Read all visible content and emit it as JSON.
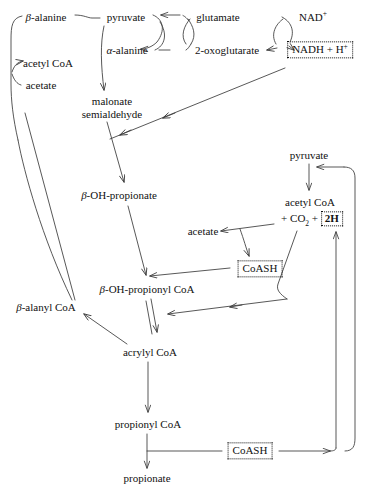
{
  "diagram": {
    "background_color": "#ffffff",
    "line_color": "#3a3a3a",
    "text_color": "#111111",
    "nodes": [
      {
        "id": "beta_alanine",
        "label": "β-alanine",
        "x": 46,
        "y": 17
      },
      {
        "id": "pyruvate_top",
        "label": "pyruvate",
        "x": 126,
        "y": 17
      },
      {
        "id": "glutamate",
        "label": "glutamate",
        "x": 218,
        "y": 17
      },
      {
        "id": "nad_plus",
        "label": "NAD",
        "sup": "+",
        "x": 313,
        "y": 17
      },
      {
        "id": "alpha_alanine",
        "label": "α-alanine",
        "x": 127,
        "y": 50
      },
      {
        "id": "oxoglutarate",
        "label": "2-oxoglutarate",
        "x": 227,
        "y": 50
      },
      {
        "id": "nadh_h",
        "label": "NADH + H",
        "sup": "+",
        "x": 320,
        "y": 50,
        "boxed": true
      },
      {
        "id": "acetyl_coa_left",
        "label": "acetyl CoA",
        "x": 48,
        "y": 63
      },
      {
        "id": "acetate_left",
        "label": "acetate",
        "x": 41,
        "y": 85
      },
      {
        "id": "malonate_semialdehyde",
        "label": "malonate\nsemialdehyde",
        "x": 112,
        "y": 108
      },
      {
        "id": "pyruvate_right",
        "label": "pyruvate",
        "x": 309,
        "y": 155
      },
      {
        "id": "beta_oh_propionate",
        "label": "β-OH-propionate",
        "x": 119,
        "y": 195
      },
      {
        "id": "acetyl_coa_right",
        "label": "acetyl CoA",
        "x": 310,
        "y": 202
      },
      {
        "id": "co2_2h",
        "label": "+ CO",
        "sub": "2",
        "suffix": " + ",
        "boxed_text": "2H",
        "x": 310,
        "y": 218
      },
      {
        "id": "acetate_right",
        "label": "acetate",
        "x": 203,
        "y": 231
      },
      {
        "id": "coash_mid",
        "label": "CoASH",
        "x": 260,
        "y": 269,
        "boxed": true
      },
      {
        "id": "beta_oh_propionyl_coa",
        "label": "β-OH-propionyl CoA",
        "x": 147,
        "y": 289
      },
      {
        "id": "beta_alanyl_coa",
        "label": "β-alanyl CoA",
        "x": 46,
        "y": 307
      },
      {
        "id": "acrylyl_coa",
        "label": "acrylyl CoA",
        "x": 150,
        "y": 352
      },
      {
        "id": "propionyl_coa",
        "label": "propionyl CoA",
        "x": 148,
        "y": 424
      },
      {
        "id": "coash_bottom",
        "label": "CoASH",
        "x": 250,
        "y": 451,
        "boxed": true
      },
      {
        "id": "propionate",
        "label": "propionate",
        "x": 147,
        "y": 478
      }
    ],
    "edges": [
      {
        "id": "beta-alanine-to-pyruvate",
        "from": "beta_alanine",
        "to": "pyruvate_top",
        "style": "curve"
      },
      {
        "id": "pyruvate-to-alpha-alanine",
        "from": "pyruvate_top",
        "to": "alpha_alanine",
        "style": "cofactor-cross"
      },
      {
        "id": "alpha-alanine-to-oxoglutarate",
        "from": "alpha_alanine",
        "to": "oxoglutarate",
        "style": "curve"
      },
      {
        "id": "glutamate-to-pyruvate",
        "from": "glutamate",
        "to": "pyruvate_top",
        "style": "cofactor-cross"
      },
      {
        "id": "nad-to-nadh",
        "from": "nad_plus",
        "to": "nadh_h",
        "style": "cofactor-cross"
      },
      {
        "id": "oxoglutarate-from-glutamate",
        "from": "glutamate",
        "to": "oxoglutarate",
        "style": "cofactor-cross"
      },
      {
        "id": "beta-alanine-to-acetyl-coa",
        "from": "beta_alanine",
        "to": "acetyl_coa_left",
        "style": "curve-left"
      },
      {
        "id": "acetate-branch",
        "from": "acetate_left",
        "to": "acetyl_coa_left",
        "style": "curve-left"
      },
      {
        "id": "alpha-alanine-to-malonate",
        "from": "alpha_alanine",
        "to": "malonate_semialdehyde",
        "style": "curve-down"
      },
      {
        "id": "nadh-to-malonate-branch",
        "from": "nadh_h",
        "to": "malonate_semialdehyde",
        "style": "long-diagonal"
      },
      {
        "id": "malonate-to-oh-propionate",
        "from": "malonate_semialdehyde",
        "to": "beta_oh_propionate",
        "style": "straight"
      },
      {
        "id": "oh-propionate-to-propionyl-coa",
        "from": "beta_oh_propionate",
        "to": "beta_oh_propionyl_coa",
        "style": "straight"
      },
      {
        "id": "coash-to-propionyl-coa",
        "from": "coash_mid",
        "to": "beta_oh_propionyl_coa",
        "style": "straight"
      },
      {
        "id": "pyruvate-to-acetyl-coa",
        "from": "pyruvate_right",
        "to": "acetyl_coa_right",
        "style": "straight"
      },
      {
        "id": "acetyl-coa-to-acetate",
        "from": "acetyl_coa_right",
        "to": "acetate_right",
        "style": "branch"
      },
      {
        "id": "acetyl-coa-to-coash",
        "from": "acetyl_coa_right",
        "to": "coash_mid",
        "style": "branch"
      },
      {
        "id": "acrylyl-equilibrium",
        "from": "beta_oh_propionyl_coa",
        "to": "acrylyl_coa",
        "style": "double-arrow"
      },
      {
        "id": "acrylyl-to-beta-alanyl-coa",
        "from": "acrylyl_coa",
        "to": "beta_alanyl_coa",
        "style": "straight"
      },
      {
        "id": "beta-alanyl-coa-to-left-loop",
        "from": "beta_alanyl_coa",
        "to": "beta_alanine",
        "style": "long-diagonal"
      },
      {
        "id": "acrylyl-to-propionyl-coa",
        "from": "acrylyl_coa",
        "to": "propionyl_coa",
        "style": "straight"
      },
      {
        "id": "propionyl-coa-to-propionate",
        "from": "propionyl_coa",
        "to": "propionate",
        "style": "straight"
      },
      {
        "id": "propionyl-coa-to-coash-bottom",
        "from": "propionyl_coa",
        "to": "coash_bottom",
        "style": "branch"
      },
      {
        "id": "coash-bottom-right-loop",
        "from": "coash_bottom",
        "to": "pyruvate_right",
        "style": "loop-right"
      },
      {
        "id": "right-loop-to-acrylyl",
        "from": "acetyl_coa_right",
        "to": "acrylyl_coa",
        "style": "loop-in"
      }
    ]
  }
}
